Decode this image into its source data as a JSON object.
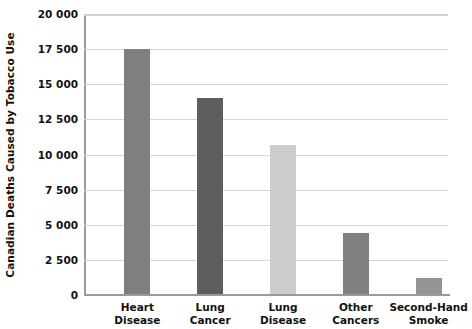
{
  "chart_data": {
    "type": "bar",
    "title": "",
    "xlabel": "",
    "ylabel": "Canadian Deaths Caused by Tobacco Use",
    "categories": [
      "Heart Disease",
      "Lung Cancer",
      "Lung Disease",
      "Other Cancers",
      "Second-Hand Smoke"
    ],
    "category_lines": [
      [
        "Heart",
        "Disease"
      ],
      [
        "Lung",
        "Cancer"
      ],
      [
        "Lung",
        "Disease"
      ],
      [
        "Other",
        "Cancers"
      ],
      [
        "Second-Hand",
        "Smoke"
      ]
    ],
    "values": [
      17500,
      14000,
      10700,
      4400,
      1200
    ],
    "bar_colors": [
      "#7f7f7f",
      "#5e5e5e",
      "#cccccc",
      "#808080",
      "#949494"
    ],
    "ylim": [
      0,
      20000
    ],
    "ytick_values": [
      20000,
      17500,
      15000,
      12500,
      10000,
      7500,
      5000,
      2500,
      0
    ],
    "ytick_labels": [
      "20 000",
      "17 500",
      "15 000",
      "12 500",
      "10 000",
      "7 500",
      "5 000",
      "2 500",
      "0"
    ],
    "grid": true,
    "legend": "none",
    "axis_color": "#9a9a9a",
    "grid_color": "#d4d4d4",
    "background": "#ffffff"
  }
}
